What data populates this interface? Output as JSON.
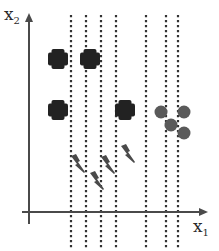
{
  "diagram": {
    "width": 219,
    "height": 251,
    "background": "#ffffff",
    "colors": {
      "axis": "#4a4a4a",
      "cross": "#222222",
      "circle": "#5a5a5a",
      "bolt": "#4a4a4a",
      "dotted_line": "#333333"
    },
    "axes": {
      "y_axis": {
        "x": 29,
        "y_top": 13,
        "y_bottom": 224,
        "label_main": "x",
        "label_sub": "2",
        "label_x": 4,
        "label_y": 24
      },
      "x_axis": {
        "y": 212,
        "x_left": 22,
        "x_right": 208,
        "label_main": "x",
        "label_sub": "1",
        "label_x": 193,
        "label_y": 236
      }
    },
    "dotted_lines": {
      "y_top": 15,
      "y_bottom": 250,
      "x_positions": [
        71,
        86,
        101,
        116,
        146,
        166,
        178
      ]
    },
    "crosses": [
      {
        "cx": 58,
        "cy": 59
      },
      {
        "cx": 90,
        "cy": 59
      },
      {
        "cx": 58,
        "cy": 110
      },
      {
        "cx": 125,
        "cy": 110
      }
    ],
    "circles": [
      {
        "cx": 161,
        "cy": 112,
        "r": 6.5
      },
      {
        "cx": 184,
        "cy": 112,
        "r": 6.5
      },
      {
        "cx": 171,
        "cy": 125,
        "r": 6.5
      },
      {
        "cx": 184,
        "cy": 133,
        "r": 6.5
      }
    ],
    "bolts": [
      {
        "x": 71,
        "y": 154
      },
      {
        "x": 90,
        "y": 171
      },
      {
        "x": 101,
        "y": 155
      },
      {
        "x": 121,
        "y": 144
      }
    ]
  }
}
